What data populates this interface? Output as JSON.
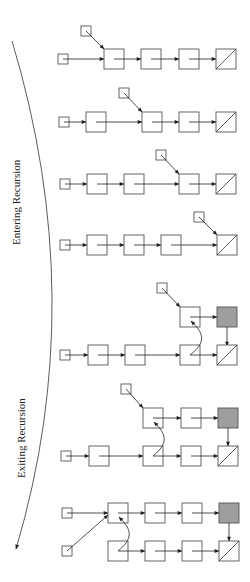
{
  "labels": {
    "entering": "Entering Recursion",
    "exiting": "Exiting Recursion"
  },
  "colors": {
    "node_border": "#555555",
    "shaded_node": "#9e9e9e",
    "arrow": "#222222"
  },
  "rows": [
    {
      "phase": "entering",
      "nodes": 4,
      "pointer_at": 1,
      "nil_last": true
    },
    {
      "phase": "entering",
      "nodes": 4,
      "pointer_at": 2,
      "nil_last": true
    },
    {
      "phase": "entering",
      "nodes": 4,
      "pointer_at": 3,
      "nil_last": true
    },
    {
      "phase": "entering",
      "nodes": 4,
      "pointer_at": 4,
      "nil_last": true
    },
    {
      "phase": "exiting",
      "reversed_nodes": 1,
      "pointer_at": 3
    },
    {
      "phase": "exiting",
      "reversed_nodes": 2,
      "pointer_at": 2
    },
    {
      "phase": "exiting",
      "reversed_nodes": 3,
      "pointer_at": 1
    }
  ]
}
